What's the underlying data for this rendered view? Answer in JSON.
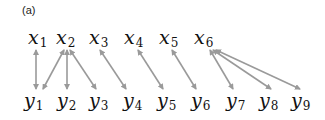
{
  "panel_label": "(a)",
  "top_nodes": [
    {
      "var": "x",
      "sub": "1",
      "x": 28
    },
    {
      "var": "x",
      "sub": "2",
      "x": 56
    },
    {
      "var": "x",
      "sub": "3",
      "x": 89
    },
    {
      "var": "x",
      "sub": "4",
      "x": 124
    },
    {
      "var": "x",
      "sub": "5",
      "x": 159
    },
    {
      "var": "x",
      "sub": "6",
      "x": 194
    }
  ],
  "bottom_nodes": [
    {
      "var": "y",
      "sub": "1",
      "x": 24
    },
    {
      "var": "y",
      "sub": "2",
      "x": 57
    },
    {
      "var": "y",
      "sub": "3",
      "x": 89
    },
    {
      "var": "y",
      "sub": "4",
      "x": 123
    },
    {
      "var": "y",
      "sub": "5",
      "x": 157
    },
    {
      "var": "y",
      "sub": "6",
      "x": 191
    },
    {
      "var": "y",
      "sub": "7",
      "x": 226
    },
    {
      "var": "y",
      "sub": "8",
      "x": 259
    },
    {
      "var": "y",
      "sub": "9",
      "x": 291
    }
  ],
  "edges": [
    {
      "from": "x1",
      "to": "y1",
      "x1": 36,
      "y1": 50,
      "x2": 36,
      "y2": 89
    },
    {
      "from": "x2",
      "to": "y1",
      "x1": 64,
      "y1": 50,
      "x2": 43,
      "y2": 89
    },
    {
      "from": "x2",
      "to": "y2",
      "x1": 67,
      "y1": 50,
      "x2": 67,
      "y2": 89
    },
    {
      "from": "x2",
      "to": "y3",
      "x1": 70,
      "y1": 50,
      "x2": 96,
      "y2": 89
    },
    {
      "from": "x3",
      "to": "y4",
      "x1": 100,
      "y1": 50,
      "x2": 126,
      "y2": 89
    },
    {
      "from": "x4",
      "to": "y5",
      "x1": 138,
      "y1": 50,
      "x2": 163,
      "y2": 89
    },
    {
      "from": "x5",
      "to": "y6",
      "x1": 172,
      "y1": 50,
      "x2": 196,
      "y2": 89
    },
    {
      "from": "x6",
      "to": "y7",
      "x1": 210,
      "y1": 50,
      "x2": 233,
      "y2": 89
    },
    {
      "from": "x6",
      "to": "y8",
      "x1": 213,
      "y1": 50,
      "x2": 271,
      "y2": 89
    },
    {
      "from": "x6",
      "to": "y9",
      "x1": 216,
      "y1": 50,
      "x2": 300,
      "y2": 89
    }
  ],
  "colors": {
    "edge": "#9a9a9a",
    "text": "#111111"
  }
}
